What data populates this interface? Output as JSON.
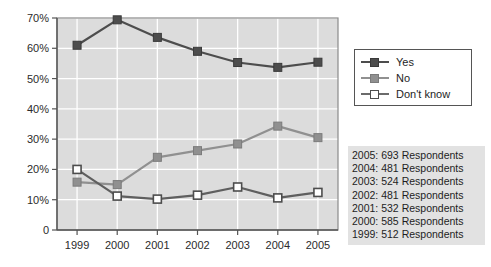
{
  "chart_data": {
    "type": "line",
    "title": "",
    "subtitle": "",
    "xlabel": "",
    "ylabel": "",
    "categories": [
      "1999",
      "2000",
      "2001",
      "2002",
      "2003",
      "2004",
      "2005"
    ],
    "series": [
      {
        "name": "Yes",
        "color": "#4d4d4d",
        "marker": "filled-square",
        "values": [
          61.0,
          69.4,
          63.6,
          59.0,
          55.3,
          53.7,
          55.4
        ]
      },
      {
        "name": "No",
        "color": "#909090",
        "marker": "gray-square",
        "values": [
          15.8,
          15.0,
          24.0,
          26.2,
          28.4,
          34.3,
          30.5
        ]
      },
      {
        "name": "Don't know",
        "color": "#6b6b6b",
        "marker": "hollow-square",
        "values": [
          20.0,
          11.2,
          10.2,
          11.5,
          14.2,
          10.6,
          12.4
        ]
      }
    ],
    "ylim": [
      0,
      70
    ],
    "yticks": [
      0,
      10,
      20,
      30,
      40,
      50,
      60,
      70
    ],
    "ytick_labels": [
      "0",
      "10%",
      "20%",
      "30%",
      "40%",
      "50%",
      "60%",
      "70%"
    ],
    "xticks": [
      "1999",
      "2000",
      "2001",
      "2002",
      "2003",
      "2004",
      "2005"
    ],
    "grid": true,
    "grid_color": "#ffffff",
    "plot_background": "#dcdcdc",
    "legend_position": "right-top"
  },
  "legend": {
    "entries": [
      {
        "label": "Yes"
      },
      {
        "label": "No"
      },
      {
        "label": "Don't know"
      }
    ]
  },
  "respondents": {
    "lines": [
      "2005: 693 Respondents",
      "2004: 481 Respondents",
      "2003: 524 Respondents",
      "2002: 481 Respondents",
      "2001: 532 Respondents",
      "2000: 585 Respondents",
      "1999: 512 Respondents"
    ]
  },
  "colors": {
    "yes": "#4d4d4d",
    "no": "#909090",
    "dont_know_outline": "#6b6b6b",
    "dont_know_fill": "#ffffff",
    "plot_bg": "#dcdcdc",
    "grid": "#ffffff",
    "axis": "#555555",
    "note_bg": "#e2e2e2"
  }
}
